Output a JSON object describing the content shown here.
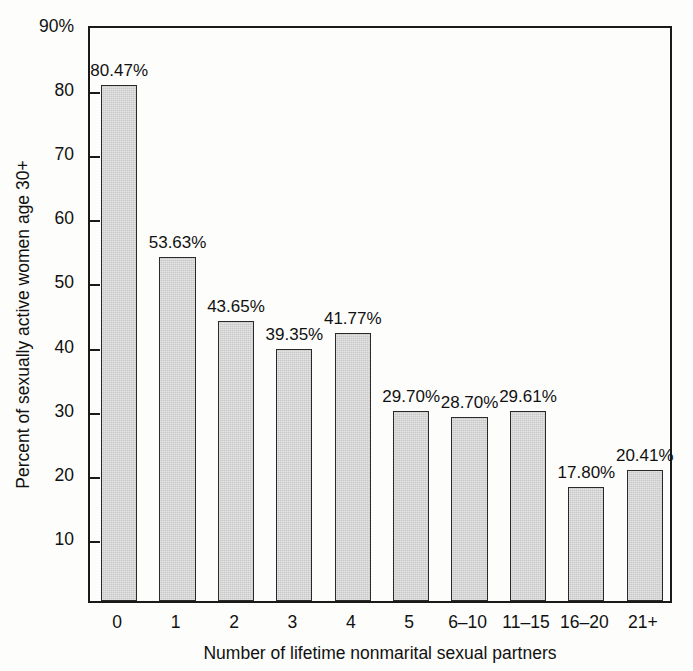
{
  "chart_data": {
    "type": "bar",
    "title": "",
    "xlabel": "Number of lifetime nonmarital sexual partners",
    "ylabel": "Percent of sexually active women age 30+",
    "categories": [
      "0",
      "1",
      "2",
      "3",
      "4",
      "5",
      "6–10",
      "11–15",
      "16–20",
      "21+"
    ],
    "values": [
      80.47,
      53.63,
      43.65,
      39.35,
      41.77,
      29.7,
      28.7,
      29.61,
      17.8,
      20.41
    ],
    "data_labels": [
      "80.47%",
      "53.63%",
      "43.65%",
      "39.35%",
      "41.77%",
      "29.70%",
      "28.70%",
      "29.61%",
      "17.80%",
      "20.41%"
    ],
    "ylim": [
      0,
      90
    ],
    "ytick_values": [
      90,
      80,
      70,
      60,
      50,
      40,
      30,
      20,
      10
    ],
    "ytick_labels": [
      "90%",
      "80",
      "70",
      "60",
      "50",
      "40",
      "30",
      "20",
      "10"
    ],
    "grid": false,
    "legend": null,
    "bar_fill_color": "#c9c9c9",
    "bar_edge_color": "#2a2a2a",
    "axis_color": "#1a1a1a",
    "background_color": "#fdfdfb"
  }
}
